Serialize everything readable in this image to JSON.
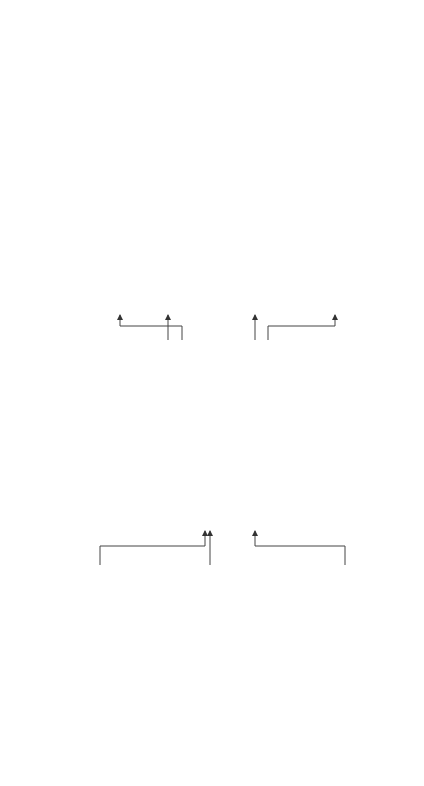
{
  "columns": [
    "1",
    "2",
    "3",
    "4"
  ],
  "inputs": [
    {
      "title": "Environmental Factors",
      "items": [
        "Industry",
        "Economic",
        "Legal (EEO/AA)",
        "Labor market"
      ]
    },
    {
      "title": "Organizational Factors",
      "items": [
        "Centralization",
        "Formalization",
        "Size",
        "Structure",
        "Strategy",
        "Unionization"
      ]
    },
    {
      "title": "Job Factors",
      "items": [
        "Characteristics, duties, and performance criteria of targeted job"
      ]
    }
  ],
  "center": {
    "title": "Promotion System Characteristics",
    "items": [
      "Promotion criteria",
      "Promotion committee",
      "Candidate identification",
      "“Fit” as a decision criterion",
      "Role of “politics”"
    ]
  },
  "outcomes": [
    {
      "title": "Grievances, Appeals, and/or Litigation"
    },
    {
      "title": "Employee Competence"
    },
    {
      "title": "Employee Attitudes and Behavior"
    },
    {
      "title": "Organizational Turnover Rate"
    }
  ],
  "final": {
    "title": "Organizational Performance"
  },
  "colors": {
    "line": "#444444",
    "background": "#ffffff"
  }
}
